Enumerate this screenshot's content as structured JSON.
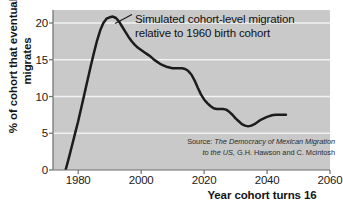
{
  "chart_data": {
    "type": "line",
    "title": "",
    "xlabel": "Year cohort turns 16",
    "ylabel": "% of cohort that eventually migrates",
    "xlim": [
      1972,
      2060
    ],
    "ylim": [
      0,
      22
    ],
    "xticks": [
      "1980",
      "2000",
      "2020",
      "2040",
      "2060"
    ],
    "xtick_values": [
      1980,
      2000,
      2020,
      2040,
      2060
    ],
    "yticks": [
      "0",
      "5",
      "10",
      "15",
      "20"
    ],
    "ytick_values": [
      0,
      5,
      10,
      15,
      20
    ],
    "grid": "horizontal",
    "legend_position": "none",
    "series": [
      {
        "name": "Simulated cohort-level migration relative to 1960 birth cohort",
        "x": [
          1976,
          1977,
          1978,
          1979,
          1980,
          1981,
          1982,
          1983,
          1984,
          1985,
          1986,
          1987,
          1988,
          1989,
          1990,
          1991,
          1992,
          1993,
          1994,
          1995,
          1996,
          1997,
          1998,
          1999,
          2000,
          2001,
          2002,
          2003,
          2004,
          2005,
          2006,
          2007,
          2008,
          2009,
          2010,
          2011,
          2012,
          2013,
          2014,
          2015,
          2016,
          2017,
          2018,
          2019,
          2020,
          2021,
          2022,
          2023,
          2024,
          2025,
          2026,
          2027,
          2028,
          2029,
          2030,
          2031,
          2032,
          2033,
          2034,
          2035,
          2036,
          2037,
          2038,
          2039,
          2040,
          2041,
          2042,
          2043,
          2044,
          2045,
          2046
        ],
        "y": [
          0.0,
          1.6,
          3.3,
          5.0,
          6.7,
          8.6,
          10.5,
          12.4,
          14.3,
          16.1,
          17.8,
          19.2,
          20.2,
          20.8,
          21.0,
          21.1,
          20.9,
          20.4,
          19.7,
          19.0,
          18.3,
          17.7,
          17.2,
          16.8,
          16.5,
          16.2,
          15.9,
          15.6,
          15.2,
          14.9,
          14.6,
          14.4,
          14.2,
          14.1,
          14.0,
          14.0,
          14.0,
          14.0,
          13.9,
          13.6,
          13.1,
          12.3,
          11.3,
          10.4,
          9.7,
          9.2,
          8.8,
          8.5,
          8.4,
          8.4,
          8.4,
          8.3,
          8.0,
          7.6,
          7.1,
          6.7,
          6.3,
          6.1,
          6.0,
          6.1,
          6.3,
          6.6,
          6.9,
          7.1,
          7.3,
          7.45,
          7.55,
          7.6,
          7.6,
          7.6,
          7.6
        ]
      }
    ],
    "annotations": [
      {
        "name": "curve-annotation",
        "line1": "Simulated cohort-level migration",
        "line2": "relative to 1960 birth cohort"
      }
    ],
    "source_note": {
      "label": "Source:",
      "title": "The Democracy of Mexican Migration",
      "line2_title": "to the US,",
      "authors": "G.H. Hawson and C. Mcintosh"
    },
    "colors": {
      "plot_background": "#c9c9c9",
      "gridline": "#f2f2f2",
      "line": "#1c1c1c",
      "axis": "#6e6e6e",
      "text": "#141414"
    }
  }
}
